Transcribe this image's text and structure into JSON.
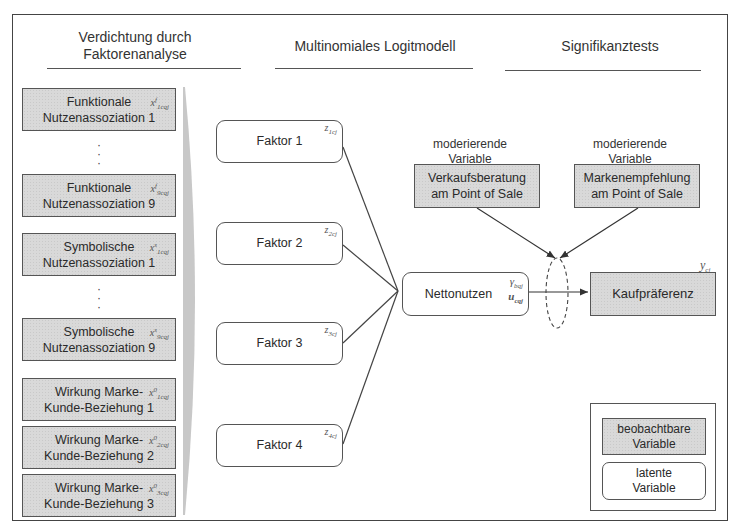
{
  "headers": {
    "stage1": "Verdichtung durch Faktorenanalyse",
    "stage1_line1": "Verdichtung durch",
    "stage1_line2": "Faktorenanalyse",
    "stage2": "Multinomiales Logitmodell",
    "stage3": "Signifikanztests"
  },
  "indicators": [
    {
      "line1": "Funktionale",
      "line2": "Nutzenassoziation 1",
      "var": "x",
      "sup": "f",
      "sub": "1cqj"
    },
    {
      "line1": "Funktionale",
      "line2": "Nutzenassoziation 9",
      "var": "x",
      "sup": "f",
      "sub": "9cqj"
    },
    {
      "line1": "Symbolische",
      "line2": "Nutzenassoziation 1",
      "var": "x",
      "sup": "s",
      "sub": "1cqj"
    },
    {
      "line1": "Symbolische",
      "line2": "Nutzenassoziation 9",
      "var": "x",
      "sup": "s",
      "sub": "9cqj"
    },
    {
      "line1": "Wirkung Marke-",
      "line2": "Kunde-Beziehung 1",
      "var": "x",
      "sup": "0",
      "sub": "1cqj"
    },
    {
      "line1": "Wirkung Marke-",
      "line2": "Kunde-Beziehung 2",
      "var": "x",
      "sup": "0",
      "sub": "2cqj"
    },
    {
      "line1": "Wirkung Marke-",
      "line2": "Kunde-Beziehung 3",
      "var": "x",
      "sup": "0",
      "sub": "3cqj"
    }
  ],
  "ellipsis": ":",
  "factors": [
    {
      "label": "Faktor 1",
      "var": "z",
      "sub": "1cj"
    },
    {
      "label": "Faktor 2",
      "var": "z",
      "sub": "2cj"
    },
    {
      "label": "Faktor 3",
      "var": "z",
      "sub": "3cj"
    },
    {
      "label": "Faktor 4",
      "var": "z",
      "sub": "4cj"
    }
  ],
  "nettonutzen": {
    "label": "Nettonutzen",
    "var1": "γ",
    "var1_sub": "bqj",
    "var2": "u",
    "var2_sub": "cqj"
  },
  "moderators": [
    {
      "caption1": "moderierende",
      "caption2": "Variable",
      "line1": "Verkaufsberatung",
      "line2": "am Point of Sale"
    },
    {
      "caption1": "moderierende",
      "caption2": "Variable",
      "line1": "Markenempfehlung",
      "line2": "am Point of Sale"
    }
  ],
  "outcome": {
    "label": "Kaufpräferenz",
    "var": "y",
    "sub": "cj"
  },
  "legend": {
    "observed_line1": "beobachtbare",
    "observed_line2": "Variable",
    "latent_line1": "latente",
    "latent_line2": "Variable"
  },
  "colors": {
    "observed_fill": "#d9d9d9",
    "latent_fill": "#ffffff",
    "line": "#444444"
  }
}
